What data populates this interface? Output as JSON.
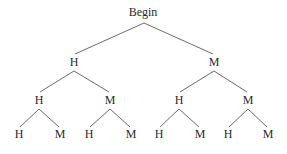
{
  "diagram": {
    "type": "tree",
    "root": "Begin",
    "nodes": [
      {
        "id": "n0",
        "label": "Begin",
        "x": 143,
        "y": 16
      },
      {
        "id": "n1",
        "label": "H",
        "x": 74,
        "y": 66
      },
      {
        "id": "n2",
        "label": "M",
        "x": 214,
        "y": 66
      },
      {
        "id": "n3",
        "label": "H",
        "x": 39,
        "y": 104
      },
      {
        "id": "n4",
        "label": "M",
        "x": 110,
        "y": 104
      },
      {
        "id": "n5",
        "label": "H",
        "x": 179,
        "y": 104
      },
      {
        "id": "n6",
        "label": "M",
        "x": 248,
        "y": 104
      },
      {
        "id": "n7",
        "label": "H",
        "x": 19,
        "y": 138
      },
      {
        "id": "n8",
        "label": "M",
        "x": 60,
        "y": 138
      },
      {
        "id": "n9",
        "label": "H",
        "x": 89,
        "y": 138
      },
      {
        "id": "n10",
        "label": "M",
        "x": 131,
        "y": 138
      },
      {
        "id": "n11",
        "label": "H",
        "x": 159,
        "y": 138
      },
      {
        "id": "n12",
        "label": "M",
        "x": 200,
        "y": 138
      },
      {
        "id": "n13",
        "label": "H",
        "x": 228,
        "y": 138
      },
      {
        "id": "n14",
        "label": "M",
        "x": 268,
        "y": 138
      }
    ],
    "edges": [
      {
        "from": "n0",
        "to": "n1",
        "x1": 144,
        "y1": 23,
        "x2": 75,
        "y2": 54
      },
      {
        "from": "n0",
        "to": "n2",
        "x1": 144,
        "y1": 23,
        "x2": 213,
        "y2": 54
      },
      {
        "from": "n1",
        "to": "n3",
        "x1": 74,
        "y1": 71,
        "x2": 40,
        "y2": 92
      },
      {
        "from": "n1",
        "to": "n4",
        "x1": 74,
        "y1": 71,
        "x2": 109,
        "y2": 92
      },
      {
        "from": "n2",
        "to": "n5",
        "x1": 214,
        "y1": 71,
        "x2": 180,
        "y2": 92
      },
      {
        "from": "n2",
        "to": "n6",
        "x1": 214,
        "y1": 71,
        "x2": 247,
        "y2": 92
      },
      {
        "from": "n3",
        "to": "n7",
        "x1": 39,
        "y1": 109,
        "x2": 20,
        "y2": 127
      },
      {
        "from": "n3",
        "to": "n8",
        "x1": 39,
        "y1": 109,
        "x2": 59,
        "y2": 127
      },
      {
        "from": "n4",
        "to": "n9",
        "x1": 110,
        "y1": 109,
        "x2": 90,
        "y2": 127
      },
      {
        "from": "n4",
        "to": "n10",
        "x1": 110,
        "y1": 109,
        "x2": 130,
        "y2": 127
      },
      {
        "from": "n5",
        "to": "n11",
        "x1": 179,
        "y1": 109,
        "x2": 160,
        "y2": 127
      },
      {
        "from": "n5",
        "to": "n12",
        "x1": 179,
        "y1": 109,
        "x2": 199,
        "y2": 127
      },
      {
        "from": "n6",
        "to": "n13",
        "x1": 248,
        "y1": 109,
        "x2": 229,
        "y2": 127
      },
      {
        "from": "n6",
        "to": "n14",
        "x1": 248,
        "y1": 109,
        "x2": 267,
        "y2": 127
      }
    ],
    "colors": {
      "line": "#6a6a6a",
      "text": "#2a2a2a",
      "background": "#ffffff"
    }
  }
}
